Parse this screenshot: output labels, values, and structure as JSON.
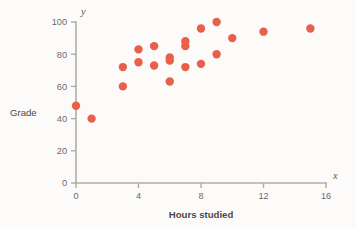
{
  "chart_data": {
    "type": "scatter",
    "title": "",
    "xlabel": "Hours studied",
    "ylabel": "Grade",
    "x_var": "x",
    "y_var": "y",
    "xlim": [
      0,
      16
    ],
    "ylim": [
      0,
      100
    ],
    "xticks": [
      0,
      4,
      8,
      12,
      16
    ],
    "yticks": [
      0,
      20,
      40,
      60,
      80,
      100
    ],
    "xticklabels": [
      "0",
      "4",
      "8",
      "12",
      "16"
    ],
    "yticklabels": [
      "0",
      "20",
      "40",
      "60",
      "80",
      "100"
    ],
    "grid": false,
    "legend": null,
    "marker_color": "#e8604c",
    "marker_size": 4.2,
    "axis_color": "#b0aca8",
    "background_color": "#fcfbf9",
    "points": [
      {
        "x": 0.0,
        "y": 48
      },
      {
        "x": 1.0,
        "y": 40
      },
      {
        "x": 3.0,
        "y": 72
      },
      {
        "x": 3.0,
        "y": 60
      },
      {
        "x": 4.0,
        "y": 83
      },
      {
        "x": 4.0,
        "y": 75
      },
      {
        "x": 5.0,
        "y": 85
      },
      {
        "x": 5.0,
        "y": 73
      },
      {
        "x": 6.0,
        "y": 78
      },
      {
        "x": 6.0,
        "y": 76
      },
      {
        "x": 6.0,
        "y": 63
      },
      {
        "x": 7.0,
        "y": 88
      },
      {
        "x": 7.0,
        "y": 85
      },
      {
        "x": 7.0,
        "y": 72
      },
      {
        "x": 8.0,
        "y": 96
      },
      {
        "x": 8.0,
        "y": 74
      },
      {
        "x": 9.0,
        "y": 100
      },
      {
        "x": 9.0,
        "y": 80
      },
      {
        "x": 10.0,
        "y": 90
      },
      {
        "x": 12.0,
        "y": 94
      },
      {
        "x": 15.0,
        "y": 96
      }
    ]
  },
  "layout": {
    "plot_left": 76,
    "plot_right": 326,
    "plot_top": 22,
    "plot_bottom": 183
  }
}
